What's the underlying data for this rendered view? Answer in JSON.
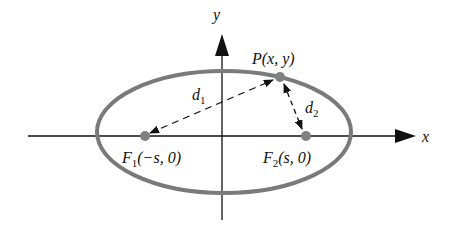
{
  "diagram": {
    "type": "ellipse-foci",
    "axes": {
      "x_label": "x",
      "y_label": "y"
    },
    "point_p": {
      "label": "P(x, y)",
      "name": "P",
      "coords": "(x, y)"
    },
    "focus_1": {
      "name": "F",
      "sub": "1",
      "coords": "(−s, 0)"
    },
    "focus_2": {
      "name": "F",
      "sub": "2",
      "coords": "(s, 0)"
    },
    "distance_1": {
      "name": "d",
      "sub": "1"
    },
    "distance_2": {
      "name": "d",
      "sub": "2"
    },
    "colors": {
      "ellipse": "#7a7a7a",
      "focus": "#808080",
      "axis": "#111111"
    }
  }
}
